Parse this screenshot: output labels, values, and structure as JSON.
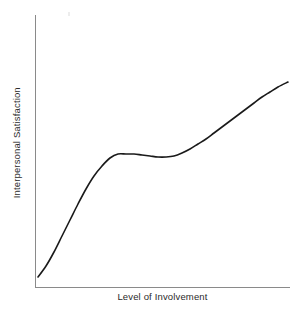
{
  "figure": {
    "background_color": "#ffffff",
    "width": 304,
    "height": 317
  },
  "chart_data": {
    "type": "line",
    "title": "",
    "subtitle": "",
    "xlabel": "Level of Involvement",
    "ylabel": "Interpersonal Satisfaction",
    "xlim": [
      0,
      100
    ],
    "ylim": [
      0,
      100
    ],
    "grid": false,
    "legend": null,
    "legend_position": "none",
    "xticks": [],
    "yticks": [],
    "xticklabels": [],
    "yticklabels": [],
    "annotations": [],
    "series": [
      {
        "name": "Interpersonal Satisfaction",
        "color": "#1a1a1a",
        "linewidth": 1.6,
        "description": "Rising S-curve: steep initial increase, long near-flat plateau with a very slight dip, then renewed increase",
        "x": [
          1,
          6,
          12,
          18,
          24,
          30,
          36,
          42,
          48,
          54,
          60,
          66,
          72,
          78,
          84,
          90,
          96,
          100
        ],
        "y": [
          4,
          9,
          17,
          29,
          42,
          51,
          55,
          56,
          56,
          55,
          55,
          56,
          58,
          62,
          68,
          75,
          84,
          89
        ]
      }
    ],
    "curve_points_px": [
      [
        38,
        277
      ],
      [
        46,
        266
      ],
      [
        54,
        252
      ],
      [
        62,
        236
      ],
      [
        70,
        220
      ],
      [
        78,
        204
      ],
      [
        86,
        189
      ],
      [
        94,
        176
      ],
      [
        102,
        166
      ],
      [
        110,
        158
      ],
      [
        118,
        154
      ],
      [
        126,
        154
      ],
      [
        134,
        154
      ],
      [
        142,
        155
      ],
      [
        150,
        156
      ],
      [
        158,
        157
      ],
      [
        166,
        157
      ],
      [
        174,
        156
      ],
      [
        182,
        153
      ],
      [
        190,
        149
      ],
      [
        198,
        144
      ],
      [
        206,
        139
      ],
      [
        214,
        133
      ],
      [
        222,
        127
      ],
      [
        230,
        121
      ],
      [
        238,
        115
      ],
      [
        246,
        109
      ],
      [
        254,
        103
      ],
      [
        262,
        97
      ],
      [
        270,
        92
      ],
      [
        278,
        87
      ],
      [
        288,
        82
      ]
    ]
  },
  "axes": {
    "color": "#8a8a8a",
    "linewidth": 1,
    "y_axis": {
      "x": 35,
      "y_top": 15,
      "y_bottom": 287
    },
    "x_axis": {
      "y": 287,
      "x_left": 35,
      "x_right": 290
    }
  },
  "artifacts": {
    "speck_label": "scan-speck"
  }
}
